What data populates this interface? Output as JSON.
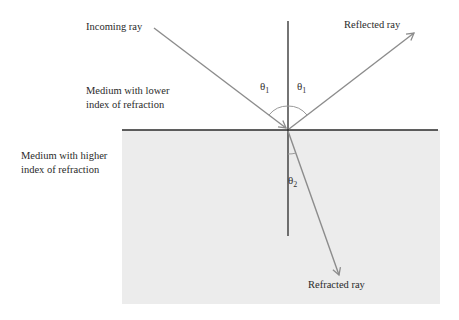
{
  "diagram": {
    "labels": {
      "incoming_ray": "Incoming ray",
      "reflected_ray": "Reflected ray",
      "refracted_ray": "Refracted ray",
      "lower_medium_line1": "Medium with lower",
      "lower_medium_line2": "index of refraction",
      "higher_medium_line1": "Medium with higher",
      "higher_medium_line2": "index of refraction"
    },
    "angles": {
      "incident": {
        "symbol": "θ",
        "subscript": "1"
      },
      "reflected": {
        "symbol": "θ",
        "subscript": "1"
      },
      "refracted": {
        "symbol": "θ",
        "subscript": "2"
      }
    },
    "colors": {
      "ray": "#8c8c8c",
      "line": "#2a2a2a",
      "higher_medium_fill": "#ececec",
      "background": "#ffffff"
    }
  }
}
